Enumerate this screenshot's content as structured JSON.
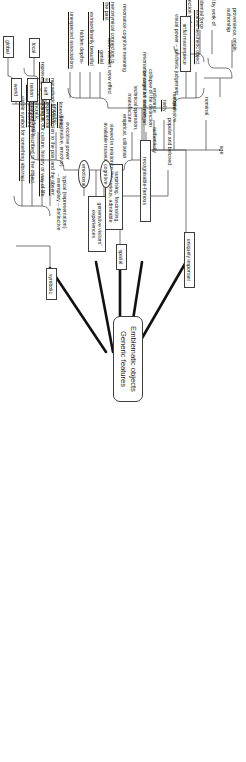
{
  "diagram": {
    "type": "mind-map",
    "title": "Emblematic objects\nGeneric features",
    "center": {
      "label": "Emblematic objects\nGeneric features"
    },
    "branches": [
      {
        "id": "uniquely-important",
        "label": "uniquely important",
        "children": [
          {
            "label": "age"
          },
          {
            "label": "authenticity",
            "children": [
              {
                "label": "nominal",
                "leaves": [
                  "provenance, origin,\nauthorship"
                ]
              },
              {
                "label": "expressive",
                "leaves": [
                  "value possessed by work of art",
                  "evidential force",
                  "metonymical connection to the past"
                ]
              }
            ]
          },
          {
            "label": "material"
          },
          {
            "label": "rarity"
          },
          {
            "label": "endurance"
          },
          {
            "label": "resonance-cognitive meaning"
          }
        ]
      },
      {
        "id": "recognisable-famous",
        "label": "recognisable-famous",
        "children": [
          {
            "label": "popular and beloved"
          },
          {
            "label": "visual power – aesthetic judgement",
            "leaves": [
              "exalted aesthetic object",
              "artful masterpiece"
            ]
          },
          {
            "label": "awe, wonder, wow effect",
            "leaves": [
              "genial",
              "extraordinarily beautiful",
              "hidden depths-",
              "unexpected associations"
            ]
          },
          {
            "label": "surprising, fascinating,\nmysterious, admirable"
          },
          {
            "label": "typical (representation)\n– exemplary – distinctive"
          }
        ]
      },
      {
        "id": "spatial",
        "label": "spatial",
        "children": [
          {
            "label": "viewed in relation to the\navailable museum space"
          }
        ]
      },
      {
        "id": "generative-visitors-experiences",
        "label": "generative visitors'\nexperiences",
        "children": [
          {
            "label": "cognitive",
            "shape": "bubble"
          },
          {
            "label": "emotional",
            "shape": "bubble"
          },
          {
            "label": "evocative power\n(imaginative, emotive)",
            "leaves": [
              "kinesthetic,\nempathic,\nexperiential",
              "multitudinous,\nidiosyncratic,\nhighly individuated"
            ]
          },
          {
            "label": "empirical, utilitarian",
            "leaves": [
              "technical operation,\nmanufacture",
              "collapse of the distinction\nbetween art and non-art"
            ]
          },
          {
            "label": "resonance-cognitive meaning",
            "leaves": [
              "metonymical connection to\nthe past"
            ]
          }
        ]
      },
      {
        "id": "symbolic",
        "label": "symbolic",
        "children": [
          {
            "label": "metaphorical connection to the past and the absent subject"
          },
          {
            "label": "representing something in our culture, history or way of life",
            "leaves": [
              "identity"
            ],
            "identity_children": [
              "self",
              "nation",
              "world",
              "local",
              "global"
            ]
          },
          {
            "label": "socio-cultural role ascribed to the object"
          },
          {
            "label": "visible symbol for something abstract"
          }
        ]
      }
    ]
  },
  "style": {
    "node_border": "#3d3d3d",
    "link_color": "#4a4a4a",
    "trunk_color": "#111111",
    "background": "#ffffff"
  }
}
